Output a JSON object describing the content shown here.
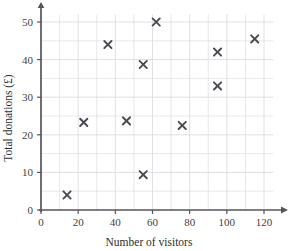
{
  "chart_data": {
    "type": "scatter",
    "title": "",
    "xlabel": "Number of visitors",
    "ylabel": "Total donations (£)",
    "xlim": [
      0,
      130
    ],
    "ylim": [
      0,
      53
    ],
    "xticks": [
      0,
      20,
      40,
      60,
      80,
      100,
      120
    ],
    "xtick_labels": [
      "0",
      "20",
      "40",
      "60",
      "80",
      "100",
      "120"
    ],
    "yticks": [
      0,
      10,
      20,
      30,
      40,
      50
    ],
    "ytick_labels": [
      "0",
      "10",
      "20",
      "30",
      "40",
      "50"
    ],
    "x_minor_step": 10,
    "y_minor_step": 5,
    "grid": true,
    "grid_color": "#d8d8dd",
    "legend": null,
    "marker": "x",
    "marker_color": "#4a4a52",
    "points": [
      {
        "x": 14,
        "y": 4
      },
      {
        "x": 23,
        "y": 23.3
      },
      {
        "x": 36,
        "y": 44
      },
      {
        "x": 46,
        "y": 23.7
      },
      {
        "x": 55,
        "y": 9.4
      },
      {
        "x": 55,
        "y": 38.7
      },
      {
        "x": 62,
        "y": 50
      },
      {
        "x": 76,
        "y": 22.5
      },
      {
        "x": 95,
        "y": 33
      },
      {
        "x": 95,
        "y": 42
      },
      {
        "x": 115,
        "y": 45.5
      }
    ]
  }
}
